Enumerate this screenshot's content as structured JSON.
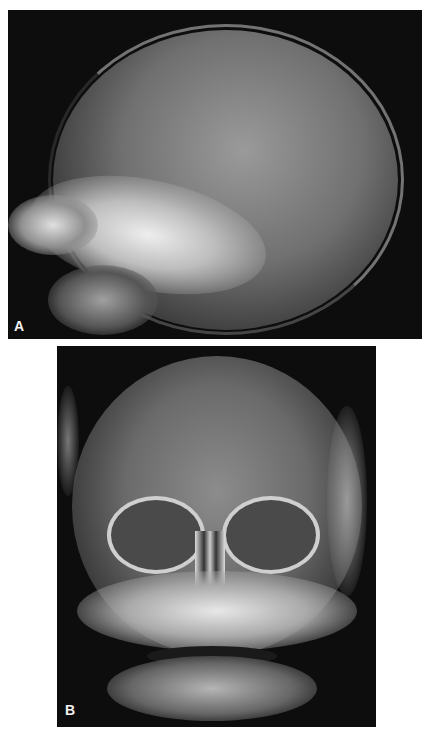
{
  "figure": {
    "panels": [
      {
        "id": "A",
        "label": "A",
        "description": "Lateral skull radiograph of an infant"
      },
      {
        "id": "B",
        "label": "B",
        "description": "Frontal (AP) skull radiograph of an infant"
      }
    ]
  },
  "colors": {
    "background": "#ffffff",
    "film": "#0d0d0d",
    "bone": "#e8e8e8",
    "label_text": "#f2f2f2"
  }
}
